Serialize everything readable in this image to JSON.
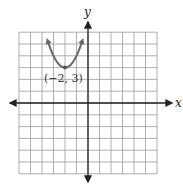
{
  "chart_data": {
    "type": "line",
    "title": "",
    "xlabel": "x",
    "ylabel": "y",
    "xlim": [
      -6,
      6
    ],
    "ylim": [
      -6,
      6
    ],
    "grid": true,
    "series": [
      {
        "name": "y = (x+2)^2 + 3",
        "x": [
          -3.45,
          -3,
          -2.5,
          -2,
          -1.5,
          -1,
          -0.55
        ],
        "y": [
          5.1,
          4,
          3.25,
          3,
          3.25,
          4,
          5.1
        ]
      }
    ],
    "annotations": [
      {
        "text": "(−2, 3)",
        "x": -2,
        "y": 3
      }
    ]
  },
  "labels": {
    "x_axis": "x",
    "y_axis": "y",
    "vertex": "(−2, 3)"
  }
}
